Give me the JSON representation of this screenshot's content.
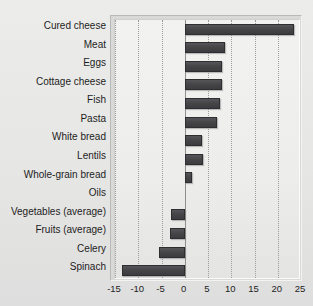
{
  "chart_data": {
    "type": "bar",
    "orientation": "horizontal",
    "title": "",
    "xlabel": "",
    "ylabel": "",
    "xlim": [
      -15,
      25
    ],
    "xticks": [
      -15,
      -10,
      -5,
      0,
      5,
      10,
      15,
      20,
      25
    ],
    "xticklabels": [
      "-15",
      "-10",
      "-5",
      "0",
      "5",
      "10",
      "15",
      "20",
      "25"
    ],
    "grid": true,
    "grid_axis": "x",
    "legend": false,
    "bar_color": "#464649",
    "categories": [
      "Cured cheese",
      "Meat",
      "Eggs",
      "Cottage cheese",
      "Fish",
      "Pasta",
      "White bread",
      "Lentils",
      "Whole-grain bread",
      "Oils",
      "Vegetables (average)",
      "Fruits (average)",
      "Celery",
      "Spinach"
    ],
    "values": [
      23.5,
      8.6,
      8.1,
      8.0,
      7.5,
      7.0,
      3.8,
      3.9,
      1.6,
      0.0,
      -3.0,
      -3.2,
      -5.6,
      -13.4
    ]
  }
}
